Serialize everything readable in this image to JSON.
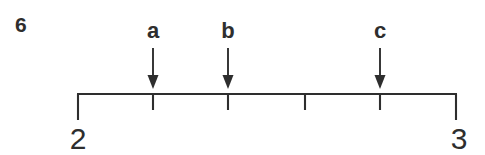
{
  "figure": {
    "problem_number": "6",
    "background_color": "#ffffff",
    "ink_color": "#2e2e2e"
  },
  "number_line": {
    "start_label": "2",
    "end_label": "3",
    "start_value": 2,
    "end_value": 3,
    "interval_count": 5,
    "interval_step": 0.2,
    "x_start_px": 77,
    "x_end_px": 457,
    "baseline_y_px": 94,
    "end_cap_length_px": 26,
    "tick_length_px": 16,
    "tick_positions_px": [
      153,
      228,
      305,
      380
    ],
    "tick_values": [
      2.2,
      2.4,
      2.6,
      2.8
    ]
  },
  "arrows": [
    {
      "label": "a",
      "x_px": 153,
      "value": 2.2,
      "label_y_px": 38,
      "shaft_top_y_px": 48,
      "shaft_bottom_y_px": 88
    },
    {
      "label": "b",
      "x_px": 228,
      "value": 2.4,
      "label_y_px": 38,
      "shaft_top_y_px": 48,
      "shaft_bottom_y_px": 88
    },
    {
      "label": "c",
      "x_px": 380,
      "value": 2.8,
      "label_y_px": 38,
      "shaft_top_y_px": 48,
      "shaft_bottom_y_px": 88
    }
  ],
  "endpoint_labels": [
    {
      "text": "2",
      "x_px": 78,
      "y_px": 149
    },
    {
      "text": "3",
      "x_px": 459,
      "y_px": 149
    }
  ],
  "problem_number_position": {
    "x_px": 15,
    "y_px": 32
  }
}
